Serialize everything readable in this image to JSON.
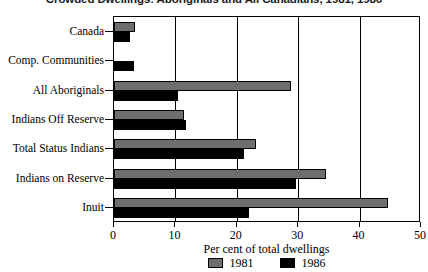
{
  "chart_data": {
    "type": "bar",
    "orientation": "horizontal",
    "title": "Crowded Dwellings: Aboriginals and All Canadians, 1981, 1986",
    "xlabel": "Per cent of total dwellings",
    "ylabel": "",
    "xlim": [
      0,
      50
    ],
    "xticks": [
      0,
      10,
      20,
      30,
      40,
      50
    ],
    "xtick_labels": [
      "0",
      "10",
      "20",
      "30",
      "40",
      "50"
    ],
    "grid": true,
    "legend_position": "bottom",
    "categories": [
      "Canada",
      "Comp. Communities",
      "All Aboriginals",
      "Indians Off Reserve",
      "Total Status Indians",
      "Indians on Reserve",
      "Inuit"
    ],
    "series": [
      {
        "name": "1981",
        "color": "#6e6e6e",
        "values": [
          3.4,
          0.0,
          28.8,
          11.4,
          23.1,
          34.5,
          44.6
        ]
      },
      {
        "name": "1986",
        "color": "#000000",
        "values": [
          2.6,
          3.3,
          10.4,
          11.8,
          21.2,
          29.6,
          22.0
        ]
      }
    ]
  },
  "legend": {
    "items": [
      {
        "label": "1981",
        "color": "#6e6e6e"
      },
      {
        "label": "1986",
        "color": "#000000"
      }
    ]
  }
}
